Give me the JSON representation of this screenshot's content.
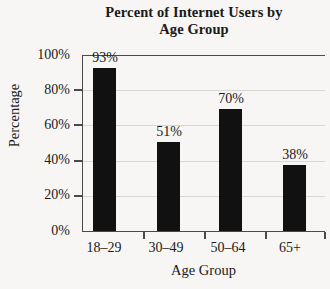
{
  "chart_data": {
    "type": "bar",
    "title": "Percent of Internet Users by Age Group",
    "title_lines": [
      "Percent of Internet Users by",
      "Age Group"
    ],
    "categories": [
      "18–29",
      "30–49",
      "50–64",
      "65+"
    ],
    "values": [
      93,
      51,
      70,
      38
    ],
    "value_labels": [
      "93%",
      "51%",
      "70%",
      "38%"
    ],
    "xlabel": "Age Group",
    "ylabel": "Percentage",
    "ylim": [
      0,
      100
    ],
    "ytick_values": [
      0,
      20,
      40,
      60,
      80,
      100
    ],
    "ytick_labels": [
      "0%",
      "20%",
      "40%",
      "60%",
      "80%",
      "100%"
    ],
    "grid": true,
    "legend": null,
    "bar_color": "#111111",
    "grid_color": "#d9d7d3",
    "axis_color": "#4a4a4a",
    "background_color": "#f7f6f4"
  }
}
